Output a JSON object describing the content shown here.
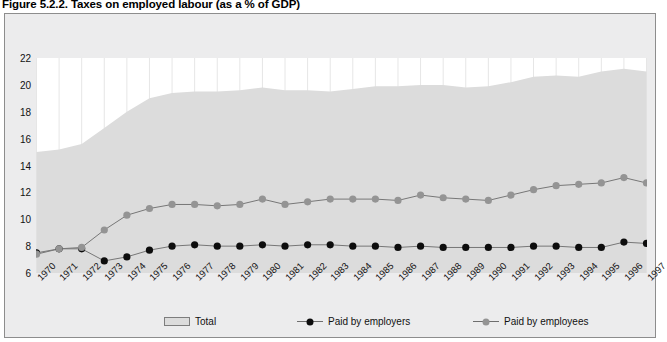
{
  "figure": {
    "title": "Figure 5.2.2. Taxes on employed labour (as a % of GDP)"
  },
  "legend": {
    "items": [
      {
        "label": "Total",
        "marker": "area-swatch",
        "color": "#dcdcdc"
      },
      {
        "label": "Paid by employers",
        "marker": "black-dot",
        "color": "#0d0d0d"
      },
      {
        "label": "Paid by employees",
        "marker": "gray-dot",
        "color": "#949494"
      }
    ]
  },
  "chart_data": {
    "type": "area",
    "title": "Figure 5.2.2. Taxes on employed labour (as a % of GDP)",
    "xlabel": "",
    "ylabel": "",
    "ylim": [
      6,
      22
    ],
    "yticks": [
      6,
      8,
      10,
      12,
      14,
      16,
      18,
      20,
      22
    ],
    "grid": true,
    "legend_position": "bottom",
    "categories": [
      "1970",
      "1971",
      "1972",
      "1973",
      "1974",
      "1975",
      "1976",
      "1977",
      "1978",
      "1979",
      "1980",
      "1981",
      "1982",
      "1983",
      "1984",
      "1985",
      "1986",
      "1987",
      "1988",
      "1989",
      "1990",
      "1991",
      "1992",
      "1993",
      "1994",
      "1995",
      "1996",
      "1997"
    ],
    "series": [
      {
        "name": "Total",
        "type": "area",
        "color": "#dcdcdc",
        "values": [
          15.0,
          15.2,
          15.6,
          16.8,
          18.0,
          19.0,
          19.4,
          19.5,
          19.5,
          19.6,
          19.8,
          19.6,
          19.6,
          19.5,
          19.7,
          19.9,
          19.9,
          20.0,
          20.0,
          19.8,
          19.9,
          20.2,
          20.6,
          20.7,
          20.6,
          21.0,
          21.2,
          21.0
        ]
      },
      {
        "name": "Paid by employers",
        "type": "line",
        "color": "#0d0d0d",
        "values": [
          7.5,
          7.8,
          7.8,
          6.9,
          7.2,
          7.7,
          8.0,
          8.1,
          8.0,
          8.0,
          8.1,
          8.0,
          8.1,
          8.1,
          8.0,
          8.0,
          7.9,
          8.0,
          7.9,
          7.9,
          7.9,
          7.9,
          8.0,
          8.0,
          7.9,
          7.9,
          8.3,
          8.2
        ]
      },
      {
        "name": "Paid by employees",
        "type": "line",
        "color": "#949494",
        "values": [
          7.4,
          7.8,
          7.9,
          9.2,
          10.3,
          10.8,
          11.1,
          11.1,
          11.0,
          11.1,
          11.5,
          11.1,
          11.3,
          11.5,
          11.5,
          11.5,
          11.4,
          11.8,
          11.6,
          11.5,
          11.4,
          11.8,
          12.2,
          12.5,
          12.6,
          12.7,
          13.1,
          12.7
        ]
      }
    ]
  }
}
